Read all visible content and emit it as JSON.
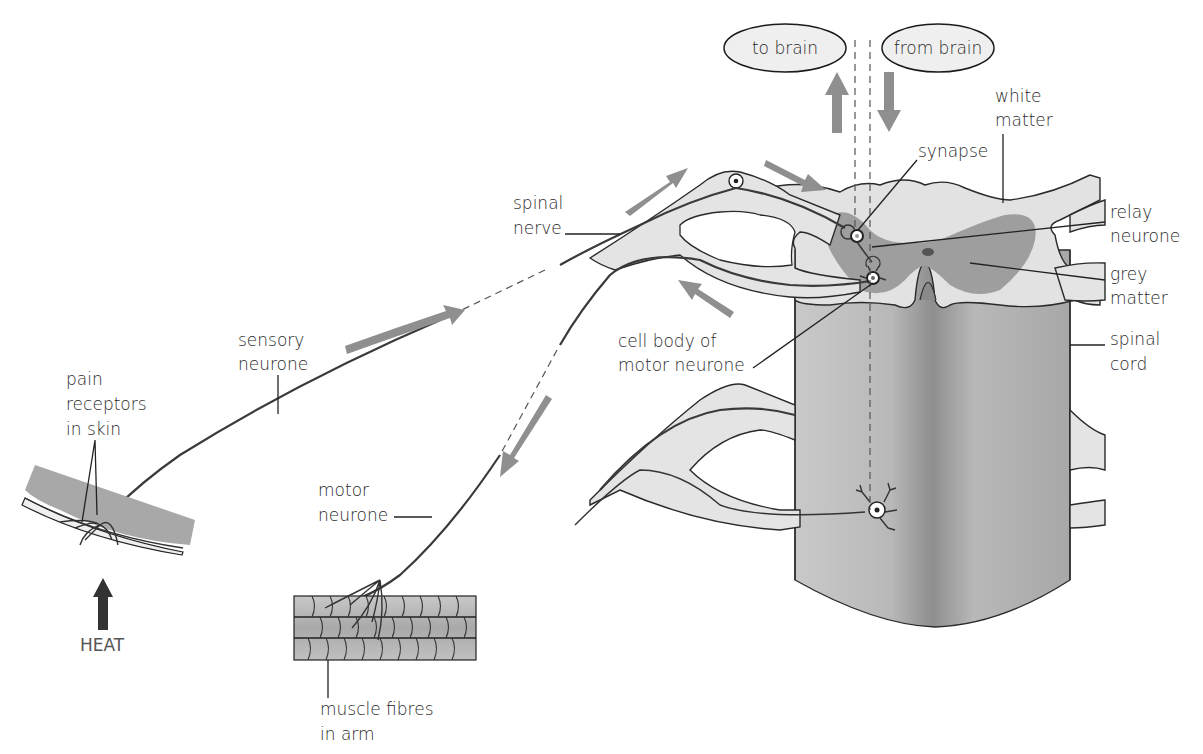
{
  "diagram": {
    "ovals": {
      "to_brain": "to brain",
      "from_brain": "from brain"
    },
    "labels": {
      "white_matter_1": "white",
      "white_matter_2": "matter",
      "synapse": "synapse",
      "relay_neurone_1": "relay",
      "relay_neurone_2": "neurone",
      "grey_matter_1": "grey",
      "grey_matter_2": "matter",
      "spinal_cord_1": "spinal",
      "spinal_cord_2": "cord",
      "spinal_nerve_1": "spinal",
      "spinal_nerve_2": "nerve",
      "cell_body_1": "cell body of",
      "cell_body_2": "motor neurone",
      "sensory_neurone_1": "sensory",
      "sensory_neurone_2": "neurone",
      "pain_receptors_1": "pain",
      "pain_receptors_2": "receptors",
      "pain_receptors_3": "in skin",
      "motor_neurone_1": "motor",
      "motor_neurone_2": "neurone",
      "muscle_fibres_1": "muscle fibres",
      "muscle_fibres_2": "in arm",
      "heat": "HEAT"
    },
    "colors": {
      "arrow_grey": "#8f8f8f",
      "heat_arrow": "#333333",
      "grey_matter": "#9e9e9e",
      "white_matter": "#e2e2e2",
      "cord_body": "#bdbdbd",
      "skin": "#a8a8a8",
      "muscle": "#b5b5b5"
    }
  }
}
